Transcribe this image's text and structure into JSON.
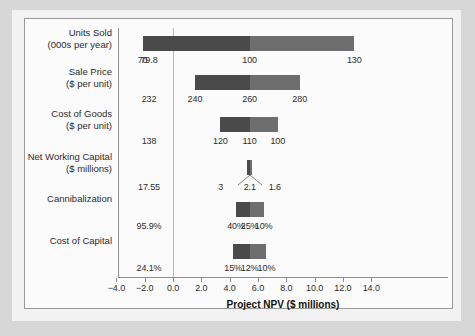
{
  "figure": {
    "axis_title": "Project NPV ($ millions)",
    "bar_color_dark": "#4a4a4a",
    "bar_color_light": "#6e6e6e"
  },
  "chart_data": {
    "type": "bar",
    "title": "",
    "xlabel": "Project NPV ($ millions)",
    "ylabel": "",
    "xlim": [
      -4.0,
      14.0
    ],
    "xticks": [
      "-4.0",
      "-2.0",
      "0.0",
      "2.0",
      "4.0",
      "6.0",
      "8.0",
      "10.0",
      "12.0",
      "14.0"
    ],
    "xtick_values": [
      -4.0,
      -2.0,
      0.0,
      2.0,
      4.0,
      6.0,
      8.0,
      10.0,
      12.0,
      14.0
    ],
    "grid": false,
    "legend": "none",
    "orientation": "horizontal-tornado",
    "categories": [
      "Units Sold (000s per year)",
      "Sale Price ($ per unit)",
      "Cost of Goods ($ per unit)",
      "Net Working Capital ($ millions)",
      "Cannibalization",
      "Cost of Capital"
    ],
    "series": [
      {
        "name": "Units Sold",
        "label_line1": "Units Sold",
        "label_line2": "(000s per year)",
        "npv_low": -2.15,
        "npv_base": 5.41,
        "npv_high": 12.8,
        "low_label": "70",
        "base_label": "100",
        "high_label": "130",
        "breakeven_label": "79.8"
      },
      {
        "name": "Sale Price",
        "label_line1": "Sale Price",
        "label_line2": "($ per unit)",
        "npv_low": 1.55,
        "npv_base": 5.41,
        "npv_high": 8.95,
        "low_label": "240",
        "base_label": "260",
        "high_label": "280",
        "breakeven_label": "232"
      },
      {
        "name": "Cost of Goods",
        "label_line1": "Cost of Goods",
        "label_line2": "($ per unit)",
        "npv_low": 3.35,
        "npv_base": 5.41,
        "npv_high": 7.4,
        "low_label": "120",
        "base_label": "110",
        "high_label": "100",
        "breakeven_label": "138"
      },
      {
        "name": "Net Working Capital",
        "label_line1": "Net Working Capital",
        "label_line2": "($ millions)",
        "npv_low": 5.25,
        "npv_base": 5.41,
        "npv_high": 5.6,
        "low_label": "3",
        "base_label": "2.1",
        "high_label": "1.6",
        "breakeven_label": "17.55"
      },
      {
        "name": "Cannibalization",
        "label_line1": "Cannibalization",
        "label_line2": "",
        "npv_low": 4.45,
        "npv_base": 5.41,
        "npv_high": 6.4,
        "low_label": "40%",
        "base_label": "25%",
        "high_label": "10%",
        "breakeven_label": "95.9%"
      },
      {
        "name": "Cost of Capital",
        "label_line1": "Cost of Capital",
        "label_line2": "",
        "npv_low": 4.25,
        "npv_base": 5.41,
        "npv_high": 6.6,
        "low_label": "15%",
        "base_label": "12%",
        "high_label": "10%",
        "breakeven_label": "24.1%"
      }
    ]
  }
}
